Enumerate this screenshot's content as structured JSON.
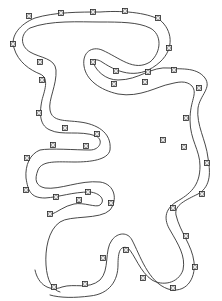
{
  "diagram": {
    "colors": {
      "background": "#ffffff",
      "line": "#333333",
      "marker_fill": "#ffffff",
      "marker_stroke": "#222222"
    },
    "outer_edge": "M35,270 C38,285 50,292 62,287 C75,283 88,290 100,280 C110,270 104,250 112,240 C118,232 128,232 132,240 C140,255 148,282 168,289 C185,294 196,280 194,262 C192,245 180,232 176,215 C174,205 186,200 198,194 C212,186 210,170 208,158 C206,140 196,125 198,108 C200,95 212,88 205,78 C196,66 178,70 170,68 C150,66 140,80 118,80 C105,80 96,70 94,64 C92,60 96,58 102,62 C120,74 140,80 160,62 C175,48 172,30 160,20 C150,14 128,10 100,12 C80,12 55,12 35,18 C20,24 10,36 14,48 C18,62 30,70 40,74 C50,78 44,92 42,100 C40,110 38,125 50,130 C62,136 80,130 96,136 C104,140 100,150 90,150 C75,150 50,148 40,150 C30,154 25,165 26,178 C28,190 30,198 45,198 C60,197 72,192 90,192 C100,193 106,200 100,205 C96,208 84,202 74,204 C64,206 58,212 50,215",
    "inner_edge": "M50,295 C60,298 75,298 90,296 C110,294 118,280 118,265 C118,252 120,245 128,248 C135,255 140,272 152,280 C162,286 178,284 183,270 C186,256 178,244 170,230 C164,220 164,210 176,202 C190,194 200,186 200,166 C200,150 190,140 190,120 C190,100 198,94 192,86 C186,80 178,82 170,84 C158,86 140,98 118,94 C100,90 86,80 84,66 C82,52 92,46 102,50 C120,58 134,72 150,62 C162,52 162,34 150,28 C138,22 120,22 100,22 C80,22 50,20 30,28 C20,34 20,46 30,52 C40,58 55,58 56,70 C57,85 48,100 50,110 C52,122 65,120 80,122 C96,124 112,132 110,150 C108,160 90,162 75,162 C58,162 42,160 38,170 C34,180 36,186 45,188 C60,190 80,180 100,182 C115,184 118,200 110,210 C100,220 70,215 60,222 C48,230 45,250 46,265 C47,280 52,290 60,292",
    "markers": [
      {
        "x": 29,
        "y": 16
      },
      {
        "x": 61,
        "y": 13
      },
      {
        "x": 93,
        "y": 12
      },
      {
        "x": 125,
        "y": 11
      },
      {
        "x": 158,
        "y": 18
      },
      {
        "x": 169,
        "y": 48
      },
      {
        "x": 13,
        "y": 44
      },
      {
        "x": 40,
        "y": 62
      },
      {
        "x": 42,
        "y": 80
      },
      {
        "x": 39,
        "y": 113
      },
      {
        "x": 65,
        "y": 128
      },
      {
        "x": 97,
        "y": 134
      },
      {
        "x": 53,
        "y": 145
      },
      {
        "x": 86,
        "y": 146
      },
      {
        "x": 93,
        "y": 62
      },
      {
        "x": 116,
        "y": 71
      },
      {
        "x": 148,
        "y": 72
      },
      {
        "x": 174,
        "y": 70
      },
      {
        "x": 199,
        "y": 88
      },
      {
        "x": 186,
        "y": 118
      },
      {
        "x": 163,
        "y": 140
      },
      {
        "x": 114,
        "y": 84
      },
      {
        "x": 145,
        "y": 82
      },
      {
        "x": 184,
        "y": 147
      },
      {
        "x": 27,
        "y": 158
      },
      {
        "x": 26,
        "y": 190
      },
      {
        "x": 56,
        "y": 197
      },
      {
        "x": 88,
        "y": 192
      },
      {
        "x": 79,
        "y": 200
      },
      {
        "x": 111,
        "y": 203
      },
      {
        "x": 50,
        "y": 214
      },
      {
        "x": 207,
        "y": 163
      },
      {
        "x": 202,
        "y": 194
      },
      {
        "x": 173,
        "y": 208
      },
      {
        "x": 186,
        "y": 236
      },
      {
        "x": 126,
        "y": 250
      },
      {
        "x": 103,
        "y": 258
      },
      {
        "x": 195,
        "y": 267
      },
      {
        "x": 143,
        "y": 278
      },
      {
        "x": 173,
        "y": 288
      },
      {
        "x": 85,
        "y": 284
      },
      {
        "x": 54,
        "y": 287
      }
    ]
  }
}
